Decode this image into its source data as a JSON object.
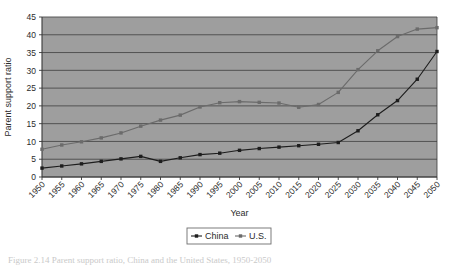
{
  "figure": {
    "background_color": "#ffffff",
    "plot_background_color": "#9e9e9e",
    "gridline_color": "#4a4a4a",
    "axis_color": "#3a3a3a",
    "caption": "Figure 2.14  Parent support ratio, China and the United States, 1950-2050"
  },
  "chart_data": {
    "type": "line",
    "title": "",
    "xlabel": "Year",
    "ylabel": "Parent support ratio",
    "ylim": [
      0,
      45
    ],
    "ytick_step": 5,
    "yticks": [
      0,
      5,
      10,
      15,
      20,
      25,
      30,
      35,
      40,
      45
    ],
    "grid": "horizontal",
    "legend_position": "bottom",
    "x": [
      1950,
      1955,
      1960,
      1965,
      1970,
      1975,
      1980,
      1985,
      1990,
      1995,
      2000,
      2005,
      2010,
      2015,
      2020,
      2025,
      2030,
      2035,
      2040,
      2045,
      2050
    ],
    "categories": [
      "1950",
      "1955",
      "1960",
      "1965",
      "1970",
      "1975",
      "1980",
      "1985",
      "1990",
      "1995",
      "2000",
      "2005",
      "2010",
      "2015",
      "2020",
      "2025",
      "2030",
      "2035",
      "2040",
      "2045",
      "2050"
    ],
    "series": [
      {
        "name": "China",
        "color": "#1d1d1d",
        "marker": "square",
        "values": [
          2.5,
          3.1,
          3.7,
          4.4,
          5.1,
          5.8,
          4.4,
          5.4,
          6.3,
          6.7,
          7.5,
          8.0,
          8.4,
          8.8,
          9.2,
          9.7,
          13.0,
          17.5,
          21.5,
          27.5,
          35.3
        ]
      },
      {
        "name": "U.S.",
        "color": "#6b6b6b",
        "marker": "square",
        "values": [
          7.8,
          9.0,
          9.9,
          11.0,
          12.4,
          14.3,
          16.0,
          17.4,
          19.7,
          20.9,
          21.2,
          21.0,
          20.8,
          19.6,
          20.4,
          23.8,
          30.2,
          35.5,
          39.5,
          41.6,
          42.0
        ]
      }
    ]
  },
  "legend": {
    "items": [
      {
        "label": "China"
      },
      {
        "label": "U.S."
      }
    ]
  }
}
